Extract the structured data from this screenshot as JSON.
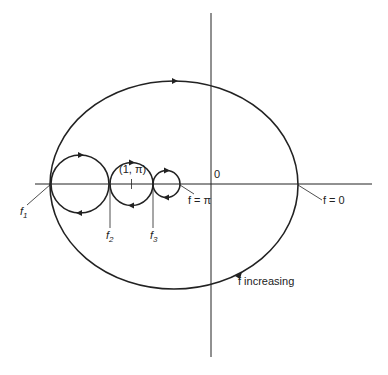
{
  "header": {
    "text": "",
    "page": ""
  },
  "labels": {
    "origin": "0",
    "f_zero": "f = 0",
    "f_pi": "f = π",
    "point": "(1, π)",
    "f1": "f",
    "f1_sub": "1",
    "f2": "f",
    "f2_sub": "2",
    "f3": "f",
    "f3_sub": "3",
    "increasing": "f increasing"
  },
  "geometry": {
    "ellipse": {
      "cx": 174,
      "cy": 185,
      "rx": 124,
      "ry": 104
    },
    "circles": [
      {
        "cx": 80,
        "cy": 184,
        "r": 29
      },
      {
        "cx": 131.5,
        "cy": 184,
        "r": 21.5
      },
      {
        "cx": 166.5,
        "cy": 184,
        "r": 13.5
      }
    ],
    "axes": {
      "x_axis_y": 184,
      "y_axis_x": 211
    }
  },
  "colors": {
    "ink": "#222222"
  }
}
